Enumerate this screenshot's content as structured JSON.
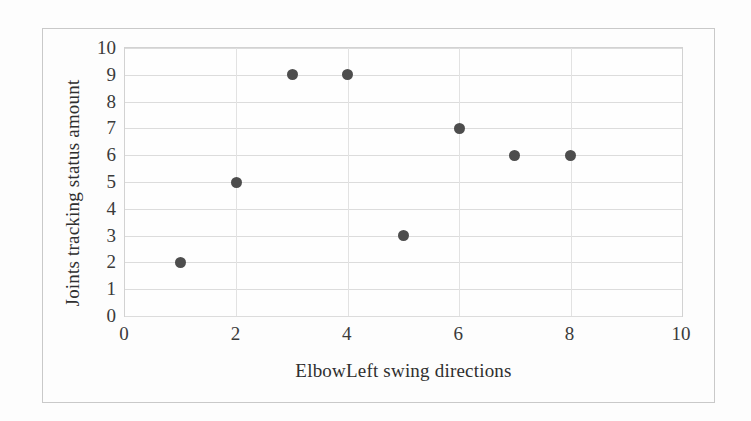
{
  "figure": {
    "background_color": "#fdfdfd",
    "frame_color": "#c9c9c9",
    "marker_color": "#4d4d4d",
    "grid_color": "#dcdcdc"
  },
  "chart_data": {
    "type": "scatter",
    "title": "",
    "xlabel": "ElbowLeft swing directions",
    "ylabel": "Joints tracking status amount",
    "xlim": [
      0,
      10
    ],
    "ylim": [
      0,
      10
    ],
    "xticks": [
      "0",
      "2",
      "4",
      "6",
      "8",
      "10"
    ],
    "xtick_values": [
      0,
      2,
      4,
      6,
      8,
      10
    ],
    "yticks": [
      "0",
      "1",
      "2",
      "3",
      "4",
      "5",
      "6",
      "7",
      "8",
      "9",
      "10"
    ],
    "ytick_values": [
      0,
      1,
      2,
      3,
      4,
      5,
      6,
      7,
      8,
      9,
      10
    ],
    "grid": "horizontal-and-vertical",
    "legend": "none",
    "x": [
      1,
      2,
      3,
      4,
      5,
      6,
      7,
      8
    ],
    "y": [
      2,
      5,
      9,
      9,
      3,
      7,
      6,
      6
    ],
    "points": [
      {
        "x": 1,
        "y": 2
      },
      {
        "x": 2,
        "y": 5
      },
      {
        "x": 3,
        "y": 9
      },
      {
        "x": 4,
        "y": 9
      },
      {
        "x": 5,
        "y": 3
      },
      {
        "x": 6,
        "y": 7
      },
      {
        "x": 7,
        "y": 6
      },
      {
        "x": 8,
        "y": 6
      }
    ],
    "series": [
      {
        "name": "Joints tracking status amount",
        "values": [
          2,
          5,
          9,
          9,
          3,
          7,
          6,
          6
        ]
      }
    ]
  }
}
